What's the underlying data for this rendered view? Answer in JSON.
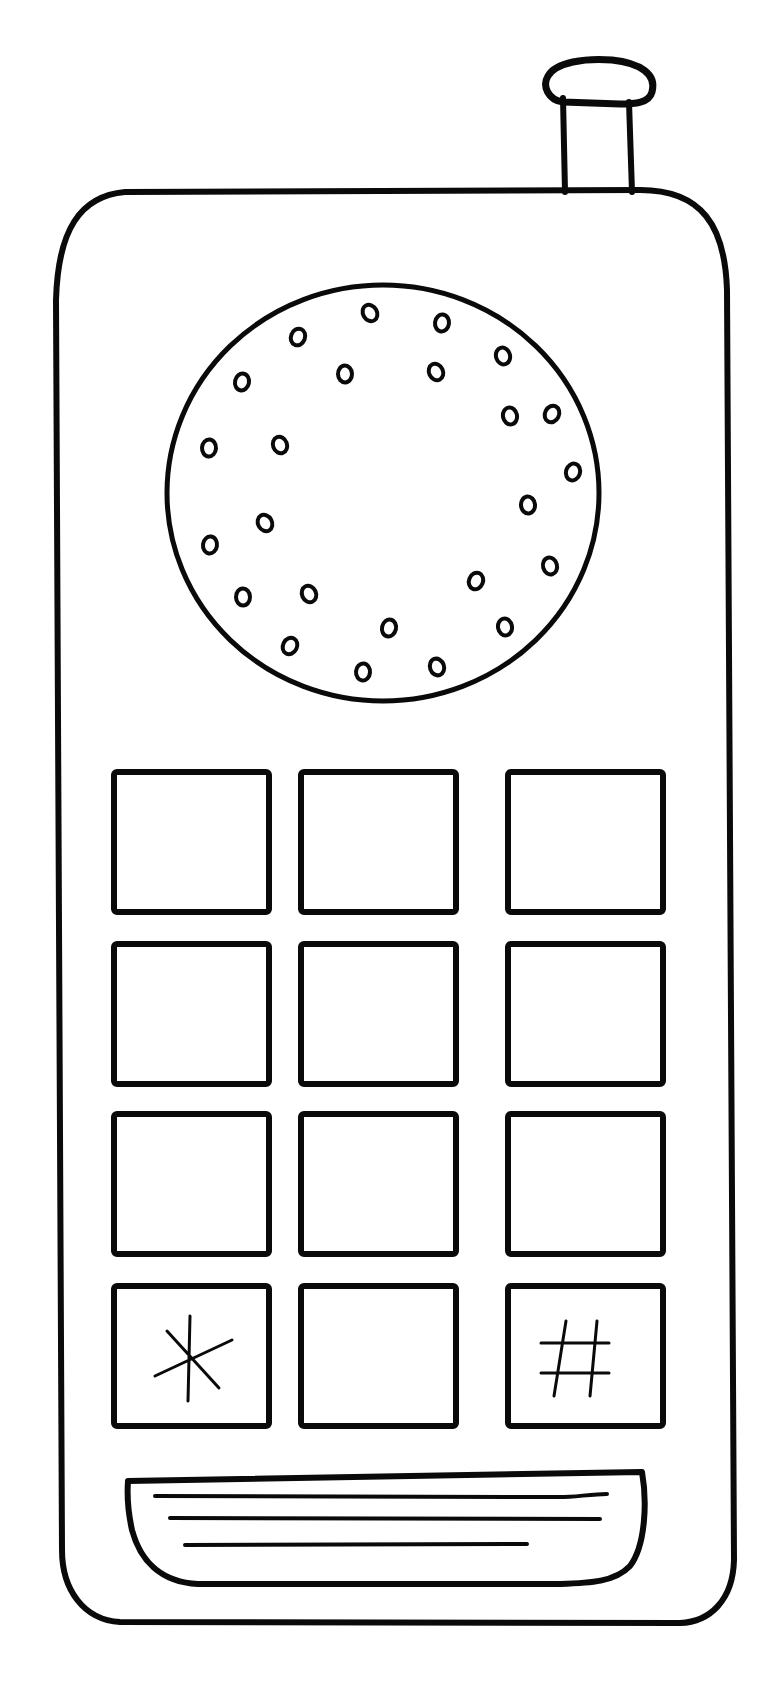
{
  "image": {
    "description": "Black line-art coloring page of a mobile phone",
    "width": 781,
    "height": 1685,
    "background": "#ffffff",
    "ink_color": "#0a0a0a"
  },
  "phone": {
    "antenna": {
      "stem": {
        "x": 563,
        "y": 98,
        "w": 70,
        "h": 96
      },
      "cap": {
        "cx": 598,
        "cy": 90,
        "rx": 54,
        "ry": 27
      }
    },
    "body": {
      "x": 52,
      "y": 190,
      "w": 684,
      "h": 1440,
      "r": 70
    },
    "speaker": {
      "cx": 383,
      "cy": 493,
      "r": 218,
      "holes": [
        [
          370,
          313
        ],
        [
          442,
          323
        ],
        [
          503,
          356
        ],
        [
          298,
          337
        ],
        [
          345,
          374
        ],
        [
          436,
          372
        ],
        [
          242,
          382
        ],
        [
          510,
          416
        ],
        [
          552,
          414
        ],
        [
          209,
          448
        ],
        [
          280,
          445
        ],
        [
          573,
          472
        ],
        [
          528,
          505
        ],
        [
          265,
          523
        ],
        [
          210,
          545
        ],
        [
          550,
          566
        ],
        [
          476,
          581
        ],
        [
          243,
          597
        ],
        [
          309,
          594
        ],
        [
          389,
          628
        ],
        [
          505,
          627
        ],
        [
          290,
          646
        ],
        [
          363,
          672
        ],
        [
          437,
          667
        ]
      ]
    },
    "keypad": {
      "columns_x": [
        114,
        301,
        508
      ],
      "rows_y": [
        772,
        944,
        1114,
        1286
      ],
      "key_w": 155,
      "key_h": 140,
      "keys": [
        {
          "label": ""
        },
        {
          "label": ""
        },
        {
          "label": ""
        },
        {
          "label": ""
        },
        {
          "label": ""
        },
        {
          "label": ""
        },
        {
          "label": ""
        },
        {
          "label": ""
        },
        {
          "label": ""
        },
        {
          "label": "*"
        },
        {
          "label": ""
        },
        {
          "label": "#"
        }
      ]
    },
    "grille": {
      "x": 127,
      "y": 1475,
      "w": 520,
      "h": 110,
      "lines": 3
    }
  }
}
